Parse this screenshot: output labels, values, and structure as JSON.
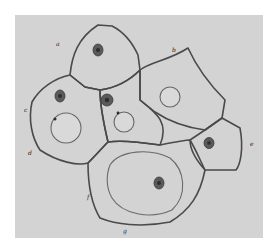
{
  "figure": {
    "background_color": "#d3d3d3",
    "page_color": "#ffffff",
    "line_color": "#4a4a4a",
    "labels": [
      "a",
      "b",
      "c",
      "d",
      "e",
      "f",
      "g"
    ],
    "cell_count": 7
  }
}
